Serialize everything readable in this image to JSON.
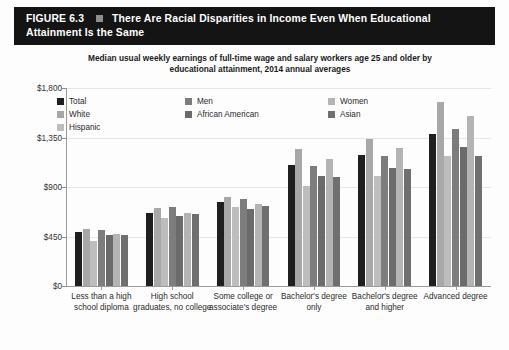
{
  "figure": {
    "number_label": "FIGURE 6.3",
    "bullet_icon": "square-bullet-icon",
    "title": "There Are Racial Disparities in Income Even When Educational Attainment Is the Same",
    "header_bg": "#141414",
    "header_fg": "#ffffff"
  },
  "subtitle": {
    "line1": "Median usual weekly earnings of full-time wage and salary workers age 25 and older by",
    "line2": "educational attainment, 2014 annual averages"
  },
  "legend": {
    "columns": [
      {
        "items": [
          {
            "label": "Total",
            "color": "#1f1f1f"
          },
          {
            "label": "White",
            "color": "#a8a8a8"
          },
          {
            "label": "Hispanic",
            "color": "#bdbdbd"
          }
        ]
      },
      {
        "items": [
          {
            "label": "Men",
            "color": "#7d7d7d"
          },
          {
            "label": "African American",
            "color": "#6b6b6b"
          }
        ]
      },
      {
        "items": [
          {
            "label": "Women",
            "color": "#b4b4b4"
          },
          {
            "label": "Asian",
            "color": "#6f6f6f"
          }
        ]
      }
    ]
  },
  "chart_data": {
    "type": "bar",
    "title": "There Are Racial Disparities in Income Even When Educational Attainment Is the Same",
    "subtitle": "Median usual weekly earnings of full-time wage and salary workers age 25 and older by educational attainment, 2014 annual averages",
    "xlabel": "",
    "ylabel": "",
    "ylim": [
      0,
      1800
    ],
    "yticks": [
      0,
      450,
      900,
      1350,
      1800
    ],
    "ytick_labels": [
      "$0",
      "$450",
      "$900",
      "$1,350",
      "$1,800"
    ],
    "grid": true,
    "legend_position": "top",
    "categories": [
      "Less than a high school diploma",
      "High school graduates, no college",
      "Some college or associate's degree",
      "Bachelor's degree only",
      "Bachelor's degree and higher",
      "Advanced degree"
    ],
    "series": [
      {
        "name": "Total",
        "color": "#1f1f1f",
        "values": [
          488,
          668,
          761,
          1101,
          1193,
          1386
        ]
      },
      {
        "name": "White",
        "color": "#a8a8a8",
        "values": [
          514,
          710,
          810,
          1249,
          1341,
          1674
        ]
      },
      {
        "name": "Hispanic",
        "color": "#bdbdbd",
        "values": [
          410,
          617,
          716,
          906,
          1002,
          1185
        ]
      },
      {
        "name": "Men",
        "color": "#7d7d7d",
        "values": [
          505,
          720,
          795,
          1090,
          1181,
          1428
        ]
      },
      {
        "name": "African American",
        "color": "#6b6b6b",
        "values": [
          460,
          635,
          700,
          1000,
          1070,
          1265
        ]
      },
      {
        "name": "Women",
        "color": "#b4b4b4",
        "values": [
          472,
          661,
          745,
          1153,
          1257,
          1545
        ]
      },
      {
        "name": "Asian",
        "color": "#6f6f6f",
        "values": [
          465,
          653,
          724,
          990,
          1061,
          1180
        ]
      }
    ]
  }
}
